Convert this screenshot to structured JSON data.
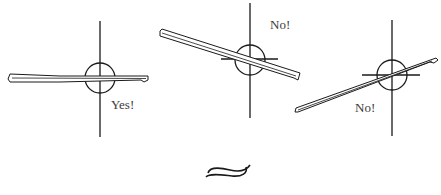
{
  "diagrams": [
    {
      "id": "level",
      "label": "Yes!",
      "verdict": "correct",
      "center": [
        100,
        78
      ],
      "label_pos": [
        111,
        97
      ]
    },
    {
      "id": "tilted-down",
      "label": "No!",
      "verdict": "incorrect",
      "center": [
        250,
        59
      ],
      "label_pos": [
        270,
        17
      ]
    },
    {
      "id": "tilted-up",
      "label": "No!",
      "verdict": "incorrect",
      "center": [
        392,
        75
      ],
      "label_pos": [
        355,
        100
      ]
    }
  ],
  "colors": {
    "ink": "#1a1a1a",
    "text": "#3a3a3a",
    "background": "#ffffff"
  },
  "ornament": {
    "name": "flourish-ornament"
  }
}
